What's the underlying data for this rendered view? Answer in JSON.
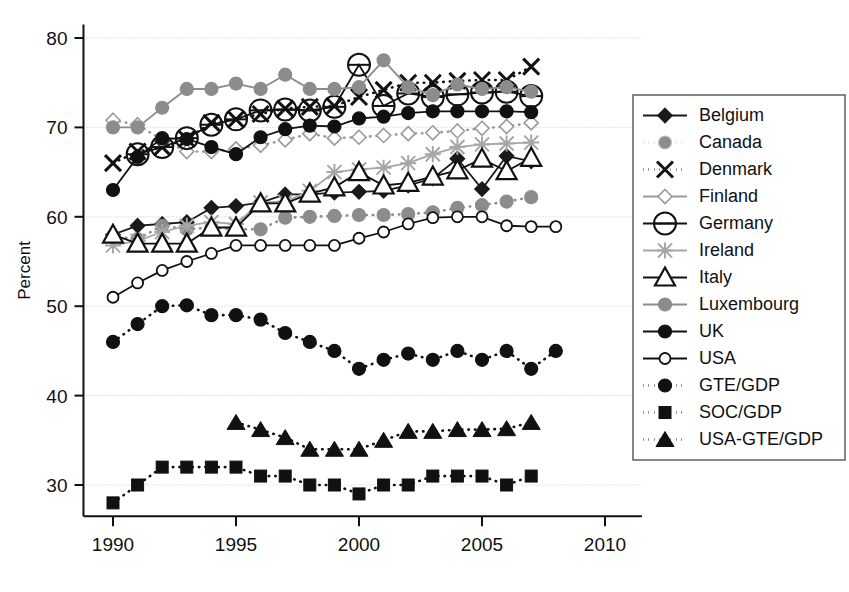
{
  "chart_data": {
    "type": "line",
    "title": "",
    "xlabel": "",
    "ylabel": "Percent",
    "xlim": [
      1988.8,
      2011.5
    ],
    "ylim": [
      26.5,
      81.5
    ],
    "xticks": [
      1990,
      1995,
      2000,
      2005,
      2010
    ],
    "yticks": [
      30,
      40,
      50,
      60,
      70,
      80
    ],
    "xtick_labels": [
      "1990",
      "1995",
      "2000",
      "2005",
      "2010"
    ],
    "ytick_labels": [
      "30",
      "40",
      "50",
      "60",
      "70",
      "80"
    ],
    "grid": "horizontal-dotted",
    "legend_position": "right-outside",
    "series": [
      {
        "name": "Belgium",
        "marker": "diamond",
        "fill": "#1a1a1a",
        "stroke": "#1a1a1a",
        "dash": "solid",
        "x": [
          1990,
          1991,
          1992,
          1993,
          1994,
          1995,
          1996,
          1997,
          1998,
          1999,
          2000,
          2001,
          2002,
          2003,
          2004,
          2005,
          2006,
          2007
        ],
        "y": [
          58.0,
          59.0,
          59.2,
          59.4,
          61.0,
          61.2,
          61.6,
          62.5,
          62.5,
          62.7,
          62.8,
          62.9,
          63.5,
          64.3,
          66.5,
          63.1,
          66.8,
          66.2
        ]
      },
      {
        "name": "Canada",
        "marker": "circle",
        "fill": "#8c8c8c",
        "stroke": "#8c8c8c",
        "dash": "dotted",
        "x": [
          1990,
          1991,
          1992,
          1993,
          1994,
          1995,
          1996,
          1997,
          1998,
          1999,
          2000,
          2001,
          2002,
          2003,
          2004,
          2005,
          2006,
          2007
        ],
        "y": [
          57.8,
          57.5,
          59.0,
          58.6,
          58.8,
          58.6,
          58.6,
          59.9,
          60.0,
          60.1,
          60.2,
          60.2,
          60.3,
          60.5,
          61.0,
          61.3,
          61.7,
          62.2
        ]
      },
      {
        "name": "Denmark",
        "marker": "x",
        "fill": "#111111",
        "stroke": "#111111",
        "dash": "dotted",
        "x": [
          1990,
          1991,
          1992,
          1993,
          1994,
          1995,
          1996,
          1997,
          1998,
          1999,
          2000,
          2001,
          2002,
          2003,
          2004,
          2005,
          2006,
          2007
        ],
        "y": [
          66.0,
          67.3,
          67.8,
          68.7,
          70.5,
          70.9,
          71.5,
          72.1,
          72.3,
          72.4,
          73.4,
          74.2,
          75.0,
          75.0,
          75.2,
          75.3,
          75.3,
          76.8
        ]
      },
      {
        "name": "Finland",
        "marker": "diamond-open",
        "fill": "#ffffff",
        "stroke": "#9a9a9a",
        "dash": "dotted",
        "x": [
          1990,
          1991,
          1992,
          1993,
          1994,
          1995,
          1996,
          1997,
          1998,
          1999,
          2000,
          2001,
          2002,
          2003,
          2004,
          2005,
          2006,
          2007
        ],
        "y": [
          70.8,
          70.3,
          68.6,
          67.3,
          67.3,
          67.6,
          68.0,
          68.6,
          69.3,
          68.8,
          68.9,
          69.1,
          69.3,
          69.4,
          69.6,
          69.9,
          70.1,
          70.5
        ]
      },
      {
        "name": "Germany",
        "marker": "circle-dash-open",
        "fill": "#ffffff",
        "stroke": "#111111",
        "dash": "solid",
        "x": [
          1991,
          1992,
          1993,
          1994,
          1995,
          1996,
          1997,
          1998,
          1999,
          2000,
          2001,
          2002,
          2003,
          2004,
          2005,
          2006,
          2007
        ],
        "y": [
          67.0,
          67.8,
          68.8,
          70.3,
          70.9,
          71.9,
          72.0,
          71.9,
          72.3,
          77.0,
          72.4,
          73.8,
          73.4,
          73.7,
          73.9,
          74.0,
          73.5
        ]
      },
      {
        "name": "Ireland",
        "marker": "star-x",
        "fill": "#a6a6a6",
        "stroke": "#a6a6a6",
        "dash": "solid",
        "x": [
          1990,
          1991,
          1992,
          1993,
          1994,
          1995,
          1996,
          1997,
          1998,
          1999,
          2000,
          2001,
          2002,
          2003,
          2004,
          2005,
          2006,
          2007
        ],
        "y": [
          56.8,
          57.3,
          58.3,
          59.0,
          59.4,
          59.2,
          61.6,
          61.7,
          62.9,
          65.0,
          65.3,
          65.5,
          66.0,
          67.0,
          67.8,
          68.1,
          68.2,
          68.3
        ]
      },
      {
        "name": "Italy",
        "marker": "triangle-open",
        "fill": "#ffffff",
        "stroke": "#111111",
        "dash": "solid",
        "x": [
          1990,
          1991,
          1992,
          1993,
          1994,
          1995,
          1996,
          1997,
          1998,
          1999,
          2000,
          2001,
          2002,
          2003,
          2004,
          2005,
          2006,
          2007
        ],
        "y": [
          58.0,
          57.0,
          57.0,
          57.0,
          58.8,
          58.8,
          61.5,
          61.5,
          62.6,
          63.3,
          65.0,
          63.5,
          63.8,
          64.5,
          65.2,
          66.5,
          65.1,
          66.6
        ]
      },
      {
        "name": "Luxembourg",
        "marker": "circle",
        "fill": "#8c8c8c",
        "stroke": "#8c8c8c",
        "dash": "solid",
        "x": [
          1990,
          1991,
          1992,
          1993,
          1994,
          1995,
          1996,
          1997,
          1998,
          1999,
          2000,
          2001,
          2002,
          2003,
          2004,
          2005,
          2006,
          2007
        ],
        "y": [
          70.0,
          70.0,
          72.2,
          74.3,
          74.3,
          74.9,
          74.3,
          75.9,
          74.3,
          74.3,
          74.5,
          77.5,
          74.5,
          73.6,
          74.8,
          74.3,
          74.5,
          74.0
        ]
      },
      {
        "name": "UK",
        "marker": "circle-filled",
        "fill": "#111111",
        "stroke": "#111111",
        "dash": "solid",
        "x": [
          1990,
          1991,
          1992,
          1993,
          1994,
          1995,
          1996,
          1997,
          1998,
          1999,
          2000,
          2001,
          2002,
          2003,
          2004,
          2005,
          2006,
          2007
        ],
        "y": [
          63.0,
          66.7,
          68.8,
          68.7,
          67.8,
          67.0,
          68.9,
          69.8,
          70.2,
          70.1,
          71.0,
          71.2,
          71.6,
          71.8,
          71.8,
          71.8,
          71.8,
          71.7
        ]
      },
      {
        "name": "USA",
        "marker": "circle-open",
        "fill": "#ffffff",
        "stroke": "#111111",
        "dash": "solid",
        "x": [
          1990,
          1991,
          1992,
          1993,
          1994,
          1995,
          1996,
          1997,
          1998,
          1999,
          2000,
          2001,
          2002,
          2003,
          2004,
          2005,
          2006,
          2007,
          2008
        ],
        "y": [
          51.0,
          52.6,
          54.0,
          55.0,
          55.9,
          56.8,
          56.8,
          56.8,
          56.8,
          56.8,
          57.6,
          58.3,
          59.2,
          59.9,
          60.0,
          60.0,
          59.0,
          58.9,
          58.9
        ]
      },
      {
        "name": "GTE/GDP",
        "marker": "circle-filled",
        "fill": "#111111",
        "stroke": "#111111",
        "dash": "dotted",
        "x": [
          1990,
          1991,
          1992,
          1993,
          1994,
          1995,
          1996,
          1997,
          1998,
          1999,
          2000,
          2001,
          2002,
          2003,
          2004,
          2005,
          2006,
          2007,
          2008
        ],
        "y": [
          46.0,
          48.0,
          50.0,
          50.1,
          49.0,
          49.0,
          48.5,
          47.0,
          46.0,
          45.0,
          43.0,
          44.0,
          44.7,
          44.0,
          45.0,
          44.0,
          45.0,
          43.0,
          45.0
        ]
      },
      {
        "name": "SOC/GDP",
        "marker": "square-filled",
        "fill": "#111111",
        "stroke": "#111111",
        "dash": "dotted",
        "x": [
          1990,
          1991,
          1992,
          1993,
          1994,
          1995,
          1996,
          1997,
          1998,
          1999,
          2000,
          2001,
          2002,
          2003,
          2004,
          2005,
          2006,
          2007
        ],
        "y": [
          28.0,
          30.0,
          32.0,
          32.0,
          32.0,
          32.0,
          31.0,
          31.0,
          30.0,
          30.0,
          29.0,
          30.0,
          30.0,
          31.0,
          31.0,
          31.0,
          30.0,
          31.0
        ]
      },
      {
        "name": "USA-GTE/GDP",
        "marker": "triangle-filled",
        "fill": "#111111",
        "stroke": "#111111",
        "dash": "dotted",
        "x": [
          1995,
          1996,
          1997,
          1998,
          1999,
          2000,
          2001,
          2002,
          2003,
          2004,
          2005,
          2006,
          2007
        ],
        "y": [
          37.0,
          36.2,
          35.3,
          34.0,
          34.0,
          34.0,
          35.0,
          36.0,
          36.0,
          36.2,
          36.2,
          36.3,
          37.0
        ]
      }
    ],
    "legend_entries": [
      {
        "label": "Belgium",
        "marker": "diamond",
        "fill": "#1a1a1a",
        "stroke": "#1a1a1a",
        "dash": "solid"
      },
      {
        "label": "Canada",
        "marker": "circle",
        "fill": "#8c8c8c",
        "stroke": "#bfbfbf",
        "dash": "dotted"
      },
      {
        "label": "Denmark",
        "marker": "x",
        "fill": "#111111",
        "stroke": "#111111",
        "dash": "dotted"
      },
      {
        "label": "Finland",
        "marker": "diamond-open",
        "fill": "#ffffff",
        "stroke": "#9a9a9a",
        "dash": "solid"
      },
      {
        "label": "Germany",
        "marker": "circle-dash-open",
        "fill": "#ffffff",
        "stroke": "#111111",
        "dash": "solid"
      },
      {
        "label": "Ireland",
        "marker": "star-x",
        "fill": "#a6a6a6",
        "stroke": "#a6a6a6",
        "dash": "solid"
      },
      {
        "label": "Italy",
        "marker": "triangle-open",
        "fill": "#ffffff",
        "stroke": "#111111",
        "dash": "solid"
      },
      {
        "label": "Luxembourg",
        "marker": "circle",
        "fill": "#8c8c8c",
        "stroke": "#8c8c8c",
        "dash": "solid"
      },
      {
        "label": "UK",
        "marker": "circle-filled",
        "fill": "#111111",
        "stroke": "#111111",
        "dash": "solid"
      },
      {
        "label": "USA",
        "marker": "circle-open",
        "fill": "#ffffff",
        "stroke": "#111111",
        "dash": "solid"
      },
      {
        "label": "GTE/GDP",
        "marker": "circle-filled",
        "fill": "#111111",
        "stroke": "#111111",
        "dash": "dotted"
      },
      {
        "label": "SOC/GDP",
        "marker": "square-filled",
        "fill": "#111111",
        "stroke": "#111111",
        "dash": "dotted"
      },
      {
        "label": "USA-GTE/GDP",
        "marker": "triangle-filled",
        "fill": "#111111",
        "stroke": "#111111",
        "dash": "dotted"
      }
    ]
  }
}
